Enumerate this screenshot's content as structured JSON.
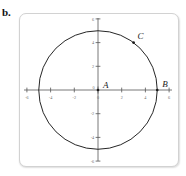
{
  "figure": {
    "part_label": "b.",
    "caption": ""
  },
  "chart_data": {
    "type": "scatter",
    "title": "",
    "xlabel": "",
    "ylabel": "",
    "xlim": [
      -6.6,
      6.6
    ],
    "ylim": [
      -6.6,
      6.6
    ],
    "grid": false,
    "legend": "none",
    "x_ticks": [
      -6,
      -4,
      -2,
      0,
      2,
      4,
      6
    ],
    "y_ticks": [
      6,
      4,
      2,
      0,
      -2,
      -4,
      -6
    ],
    "x_tick_labels": [
      "-6",
      "-4",
      "-2",
      "0",
      "2",
      "4",
      "6"
    ],
    "y_tick_labels": [
      "6",
      "4",
      "2",
      "0",
      "-2",
      "-4",
      "-6"
    ],
    "shapes": [
      {
        "kind": "circle",
        "center": [
          0,
          0
        ],
        "radius": 5,
        "stroke": "#1a1a1a",
        "fill": "none"
      }
    ],
    "points": [
      {
        "label": "A",
        "x": 0,
        "y": 0,
        "marker": "dot"
      },
      {
        "label": "B",
        "x": 5,
        "y": 0,
        "marker": "dot"
      },
      {
        "label": "C",
        "x": 3,
        "y": 4,
        "marker": "dot"
      }
    ],
    "point_labels": [
      "A",
      "B",
      "C"
    ],
    "colors": {
      "curve": "#1a1a1a",
      "axis": "#555555",
      "tick_text": "#6d6d6d",
      "frame": "#d2d2d2",
      "background": "#ffffff"
    }
  }
}
